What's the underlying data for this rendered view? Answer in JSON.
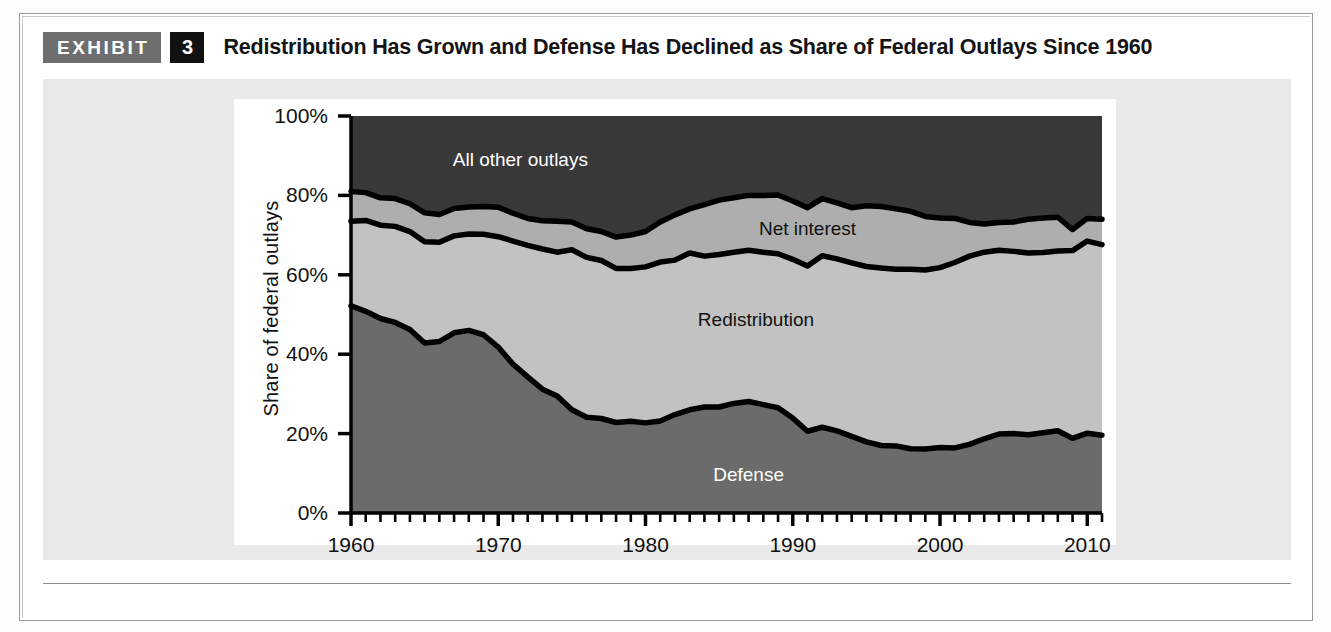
{
  "exhibit": {
    "badge_label": "EXHIBIT",
    "number": "3",
    "title": "Redistribution Has Grown and Defense Has Declined as Share of Federal Outlays Since 1960"
  },
  "chart_data": {
    "type": "area",
    "stacked": true,
    "title": "Redistribution Has Grown and Defense Has Declined as Share of Federal Outlays Since 1960",
    "xlabel": "",
    "ylabel": "Share of federal outlays",
    "ylim": [
      0,
      100
    ],
    "xlim": [
      1960,
      2011
    ],
    "grid": false,
    "legend_position": "inline-labels",
    "y_ticks": [
      "0%",
      "20%",
      "40%",
      "60%",
      "80%",
      "100%"
    ],
    "y_tick_values": [
      0,
      20,
      40,
      60,
      80,
      100
    ],
    "x_ticks": [
      "1960",
      "1970",
      "1980",
      "1990",
      "2000",
      "2010"
    ],
    "x_tick_values": [
      1960,
      1970,
      1980,
      1990,
      2000,
      2010
    ],
    "x_minor_tick_interval": 1,
    "x": [
      1960,
      1961,
      1962,
      1963,
      1964,
      1965,
      1966,
      1967,
      1968,
      1969,
      1970,
      1971,
      1972,
      1973,
      1974,
      1975,
      1976,
      1977,
      1978,
      1979,
      1980,
      1981,
      1982,
      1983,
      1984,
      1985,
      1986,
      1987,
      1988,
      1989,
      1990,
      1991,
      1992,
      1993,
      1994,
      1995,
      1996,
      1997,
      1998,
      1999,
      2000,
      2001,
      2002,
      2003,
      2004,
      2005,
      2006,
      2007,
      2008,
      2009,
      2010,
      2011
    ],
    "series": [
      {
        "name": "Defense",
        "color": "#6b6b6b",
        "label_color": "#ffffff",
        "values": [
          52.2,
          50.8,
          49.0,
          48.0,
          46.2,
          42.8,
          43.2,
          45.4,
          46.0,
          44.9,
          41.8,
          37.5,
          34.3,
          31.2,
          29.5,
          26.0,
          24.1,
          23.8,
          22.8,
          23.1,
          22.7,
          23.2,
          24.8,
          26.0,
          26.7,
          26.7,
          27.6,
          28.1,
          27.3,
          26.5,
          23.9,
          20.6,
          21.6,
          20.7,
          19.3,
          17.9,
          17.0,
          16.9,
          16.2,
          16.1,
          16.5,
          16.4,
          17.3,
          18.7,
          19.9,
          20.0,
          19.7,
          20.2,
          20.7,
          18.8,
          20.1,
          19.6
        ]
      },
      {
        "name": "Redistribution",
        "color": "#c2c2c2",
        "label_color": "#111111",
        "values": [
          21.3,
          22.9,
          23.5,
          24.2,
          24.7,
          25.5,
          25.0,
          24.4,
          24.3,
          25.3,
          27.8,
          31.0,
          33.1,
          35.3,
          36.2,
          40.3,
          40.3,
          39.8,
          38.8,
          38.5,
          39.3,
          40.0,
          38.9,
          39.5,
          38.0,
          38.4,
          38.1,
          38.1,
          38.4,
          38.8,
          40.0,
          41.6,
          43.2,
          43.3,
          43.7,
          44.2,
          44.7,
          44.5,
          45.2,
          45.1,
          45.3,
          46.7,
          47.4,
          47.0,
          46.3,
          45.9,
          45.8,
          45.4,
          45.3,
          47.3,
          48.4,
          48.0
        ]
      },
      {
        "name": "Net interest",
        "color": "#aeaeae",
        "label_color": "#111111",
        "values": [
          7.5,
          7.0,
          6.9,
          7.0,
          7.0,
          7.3,
          7.0,
          6.9,
          6.8,
          7.0,
          7.4,
          7.0,
          6.8,
          7.1,
          7.8,
          7.0,
          7.2,
          7.3,
          7.9,
          8.4,
          8.9,
          10.1,
          11.4,
          11.1,
          13.0,
          13.7,
          13.7,
          13.8,
          14.3,
          14.8,
          14.7,
          14.7,
          14.4,
          14.1,
          13.9,
          15.3,
          15.5,
          15.2,
          14.6,
          13.5,
          12.5,
          11.1,
          8.5,
          7.1,
          7.0,
          7.4,
          8.5,
          8.7,
          8.5,
          5.3,
          5.7,
          6.4
        ]
      },
      {
        "name": "All other outlays",
        "color": "#383838",
        "label_color": "#ffffff",
        "values": [
          19.0,
          19.3,
          20.6,
          20.8,
          22.1,
          24.4,
          24.8,
          23.3,
          22.9,
          22.8,
          23.0,
          24.5,
          25.8,
          26.4,
          26.5,
          26.7,
          28.4,
          29.1,
          30.5,
          30.0,
          29.1,
          26.7,
          24.9,
          23.4,
          22.3,
          21.2,
          20.6,
          20.0,
          20.0,
          19.9,
          21.4,
          23.1,
          20.8,
          21.9,
          23.1,
          22.6,
          22.8,
          23.4,
          24.0,
          25.3,
          25.7,
          25.8,
          26.8,
          27.2,
          26.8,
          26.7,
          26.0,
          25.7,
          25.5,
          28.6,
          25.8,
          26.0
        ]
      }
    ],
    "series_label_positions": [
      {
        "name": "All other outlays",
        "x": 1971.5,
        "y": 89.0
      },
      {
        "name": "Net interest",
        "x": 1991.0,
        "y": 71.5
      },
      {
        "name": "Redistribution",
        "x": 1987.5,
        "y": 48.5
      },
      {
        "name": "Defense",
        "x": 1987.0,
        "y": 9.5
      }
    ]
  },
  "colors": {
    "defense": "#6b6b6b",
    "redistribution": "#c2c2c2",
    "net_interest": "#aeaeae",
    "all_other": "#383838",
    "boundary_line": "#000000",
    "panel_background": "#e9e9e9",
    "badge_gray": "#6e6e6e",
    "badge_black": "#111111"
  }
}
